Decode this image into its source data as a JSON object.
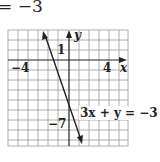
{
  "header": {
    "equation_fragment": "= −3"
  },
  "graph": {
    "axis_labels": {
      "x": "x",
      "y": "y"
    },
    "tick_labels": {
      "x_neg": "−4",
      "x_pos": "4",
      "y_pos": "1",
      "y_neg": "−7"
    },
    "line_label": "3x + y = −3",
    "line": {
      "slope": -3,
      "intercept": -3,
      "equation": "3x + y = -3"
    },
    "colors": {
      "grid": "#8a8a8a",
      "axis": "#222222",
      "line": "#222222"
    }
  }
}
